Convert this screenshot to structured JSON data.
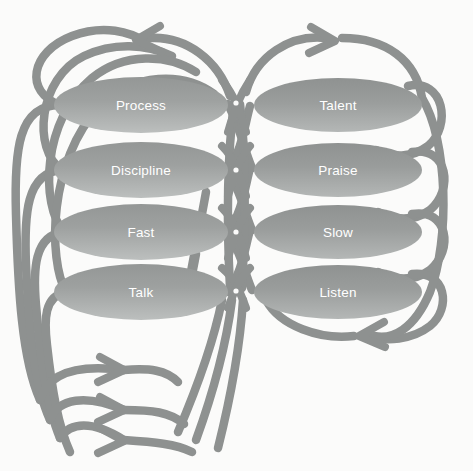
{
  "diagram": {
    "type": "cycle-loop-diagram",
    "background_color": "#fbfbfa",
    "arc_color": "#8e9190",
    "arc_color_light": "#a3a6a5",
    "node_fill_top": "#9a9d9c",
    "node_fill_bottom": "#b6b9b8",
    "node_label_color": "#ffffff",
    "columns": [
      {
        "side": "left",
        "nodes": [
          {
            "label": "Process",
            "cx": 141,
            "cy": 105,
            "rx": 87,
            "ry": 28
          },
          {
            "label": "Discipline",
            "cx": 141,
            "cy": 170,
            "rx": 87,
            "ry": 28
          },
          {
            "label": "Fast",
            "cx": 141,
            "cy": 232,
            "rx": 87,
            "ry": 28
          },
          {
            "label": "Talk",
            "cx": 141,
            "cy": 292,
            "rx": 87,
            "ry": 28
          }
        ]
      },
      {
        "side": "right",
        "nodes": [
          {
            "label": "Talent",
            "cx": 338,
            "cy": 105,
            "rx": 84,
            "ry": 27
          },
          {
            "label": "Praise",
            "cx": 338,
            "cy": 170,
            "rx": 84,
            "ry": 27
          },
          {
            "label": "Slow",
            "cx": 338,
            "cy": 232,
            "rx": 84,
            "ry": 27
          },
          {
            "label": "Listen",
            "cx": 338,
            "cy": 292,
            "rx": 84,
            "ry": 27
          }
        ]
      }
    ],
    "arrowheads": [
      {
        "name": "top-left-arrowhead",
        "x": 138,
        "y": 40,
        "direction": "left"
      },
      {
        "name": "top-right-arrowhead",
        "x": 333,
        "y": 41,
        "direction": "right"
      },
      {
        "name": "bottom-right-arrowhead",
        "x": 362,
        "y": 335,
        "direction": "left"
      },
      {
        "name": "bottom-left-arrowhead-1",
        "x": 112,
        "y": 373,
        "direction": "right"
      },
      {
        "name": "bottom-left-arrowhead-2",
        "x": 112,
        "y": 412,
        "direction": "right"
      },
      {
        "name": "bottom-left-arrowhead-3",
        "x": 112,
        "y": 441,
        "direction": "right"
      }
    ],
    "crossing_dots": [
      {
        "x": 236,
        "y": 103
      },
      {
        "x": 236,
        "y": 170
      },
      {
        "x": 236,
        "y": 232
      },
      {
        "x": 236,
        "y": 291
      }
    ]
  }
}
